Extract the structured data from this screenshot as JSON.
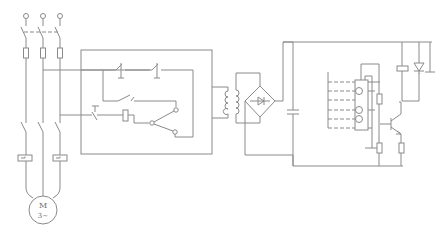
{
  "diagram": {
    "type": "electrical-schematic",
    "line_color": "#8a8a8a",
    "background": "#ffffff",
    "motor": {
      "label_top": "M",
      "label_bottom": "3~"
    },
    "sections": [
      {
        "name": "power-circuit",
        "components": [
          "three-phase-terminals",
          "knife-switch",
          "fuses",
          "contactor-main-contacts",
          "thermal-overload-relays",
          "motor"
        ]
      },
      {
        "name": "control-circuit",
        "components": [
          "stop-button",
          "start-button",
          "holding-contact",
          "limit-switch",
          "contactor-coil",
          "selector-switch"
        ]
      },
      {
        "name": "transformer",
        "components": [
          "control-transformer"
        ]
      },
      {
        "name": "rectifier",
        "components": [
          "bridge-rectifier",
          "filter-capacitor"
        ]
      },
      {
        "name": "detection-circuit",
        "components": [
          "sensor-array",
          "resistors",
          "transistor",
          "relay-coil",
          "flyback-diode"
        ]
      }
    ]
  }
}
